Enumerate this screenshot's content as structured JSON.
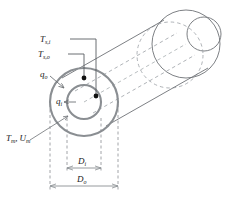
{
  "figure": {
    "background_color": "#ffffff"
  },
  "colors": {
    "outline": "#6e7276",
    "annulus_stroke": "#8a8e92",
    "hidden_dashed": "#9aa0a4",
    "leader": "#5a5e62",
    "dimension": "#8a8e92",
    "marker_dot": "#111111",
    "text": "#1a1a1a"
  },
  "labels": {
    "t_s_i": {
      "base": "T",
      "sub": "s,i"
    },
    "t_s_o": {
      "base": "T",
      "sub": "s,o"
    },
    "q_o": {
      "base": "q",
      "sub": "o"
    },
    "q_i": {
      "base": "q",
      "sub": "i"
    },
    "t_m": {
      "base": "T",
      "sub": "m"
    },
    "comma": ",",
    "u_m": {
      "base": "U",
      "sub": "m"
    },
    "d_i": {
      "base": "D",
      "sub": "i"
    },
    "d_o": {
      "base": "D",
      "sub": "o"
    }
  },
  "geometry": {
    "outer_circle": {
      "cx": 84,
      "cy": 102,
      "r": 34
    },
    "inner_circle": {
      "cx": 84,
      "cy": 102,
      "r": 17
    },
    "far_outer_circle": {
      "cx": 186,
      "cy": 44,
      "r": 34
    },
    "far_inner_circle": {
      "cx": 204,
      "cy": 34,
      "r": 17
    },
    "dim_inner": {
      "x1": 67,
      "x2": 101,
      "y": 168
    },
    "dim_outer": {
      "x1": 50,
      "x2": 118,
      "y": 186
    }
  },
  "markers": [
    {
      "name": "outer-surface-point",
      "x": 84,
      "y": 78
    },
    {
      "name": "inner-surface-point",
      "x": 96,
      "y": 96
    }
  ]
}
